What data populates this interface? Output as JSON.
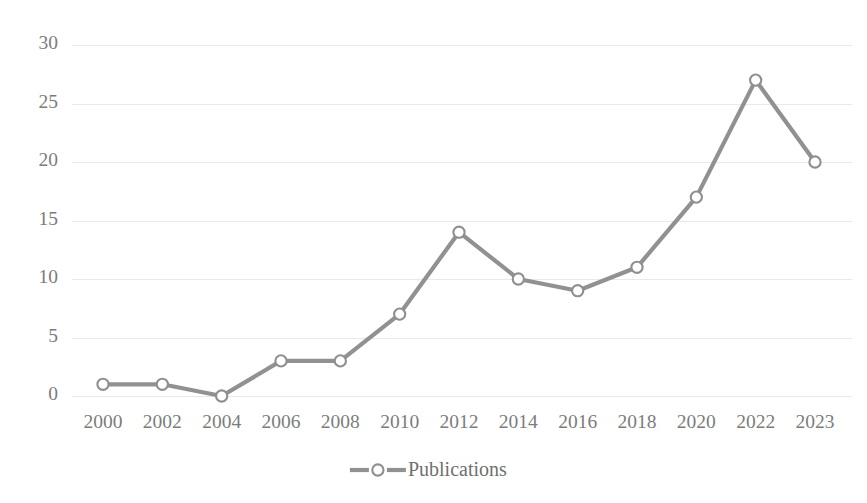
{
  "chart_data": {
    "type": "line",
    "title": "",
    "subtitle": "",
    "xlabel": "",
    "ylabel": "",
    "categories": [
      "2000",
      "2002",
      "2004",
      "2006",
      "2008",
      "2010",
      "2012",
      "2014",
      "2016",
      "2018",
      "2020",
      "2022",
      "2023"
    ],
    "series": [
      {
        "name": "Publications",
        "values": [
          1,
          1,
          0,
          3,
          3,
          7,
          14,
          10,
          9,
          11,
          17,
          27,
          20
        ]
      }
    ],
    "ylim": [
      0,
      30
    ],
    "yticks": [
      0,
      5,
      10,
      15,
      20,
      25,
      30
    ],
    "ytick_labels": [
      "0",
      "5",
      "10",
      "15",
      "20",
      "25",
      "30"
    ],
    "grid": true,
    "grid_axis": "y",
    "legend": {
      "position": "bottom",
      "entries": [
        {
          "label": "Publications",
          "marker": "open-circle",
          "line_color": "#919191",
          "marker_fill": "#ffffff",
          "marker_stroke": "#8f8f8f"
        }
      ]
    },
    "colors": {
      "line": "#919191",
      "marker_fill": "#ffffff",
      "marker_stroke": "#8f8f8f",
      "gridline": "#e9e9e9",
      "tick_text": "#7c7c7c",
      "legend_text": "#6f6f6f",
      "background": "#ffffff"
    }
  }
}
